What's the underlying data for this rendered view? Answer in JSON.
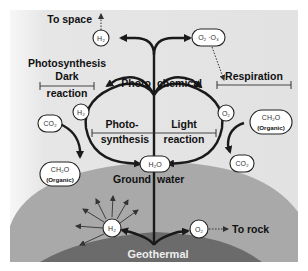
{
  "labels": {
    "to_space": "To space",
    "photosynthesis": "Photosynthesis",
    "dark_line1": "Dark",
    "dark_line2": "reaction",
    "photo": "Photo",
    "chemical": "chemical",
    "respiration": "Respiration",
    "photo_syn_line1": "Photo-",
    "photo_syn_line2": "synthesis",
    "light_line1": "Light",
    "light_line2": "reaction",
    "ground": "Ground",
    "water": "water",
    "geothermal": "Geothermal",
    "to_rock": "To rock"
  },
  "nodes": {
    "h2_top": "H₂",
    "o2_o3_top": "O₂ ·O₃",
    "h2_left": "H₂",
    "co2_left": "CO₂",
    "ch2o_left": "CH₂O",
    "ch2o_left_sub": "Organic",
    "o2_right": "O₂",
    "ch2o_right": "CH₂O",
    "ch2o_right_sub": "Organic",
    "co2_right": "CO₂",
    "h2o_center": "H₂O",
    "h2_ground": "H₂",
    "o2_ground": "O₂"
  },
  "colors": {
    "sky": "#e4e4e4",
    "earth": "#a9a9a9",
    "core": "#6b6b6b",
    "stroke": "#1a1a1a"
  }
}
